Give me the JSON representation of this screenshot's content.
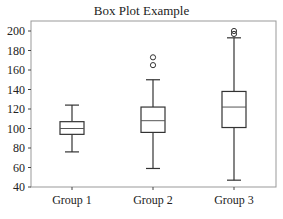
{
  "chart_data": {
    "type": "box",
    "title": "Box Plot Example",
    "xlabel": "",
    "ylabel": "",
    "categories": [
      "Group 1",
      "Group 2",
      "Group 3"
    ],
    "ylim": [
      40,
      205
    ],
    "yticks": [
      40,
      60,
      80,
      100,
      120,
      140,
      160,
      180,
      200
    ],
    "grid": false,
    "series": [
      {
        "name": "Group 1",
        "whisker_low": 76,
        "q1": 94,
        "median": 100,
        "q3": 107,
        "whisker_high": 124,
        "outliers": []
      },
      {
        "name": "Group 2",
        "whisker_low": 59,
        "q1": 96,
        "median": 108,
        "q3": 122,
        "whisker_high": 150,
        "outliers": [
          165,
          173
        ]
      },
      {
        "name": "Group 3",
        "whisker_low": 47,
        "q1": 101,
        "median": 122,
        "q3": 138,
        "whisker_high": 193,
        "outliers": [
          197,
          200
        ]
      }
    ],
    "colors": {
      "box": "#333333",
      "median": "#555555",
      "axis": "#444444"
    }
  }
}
